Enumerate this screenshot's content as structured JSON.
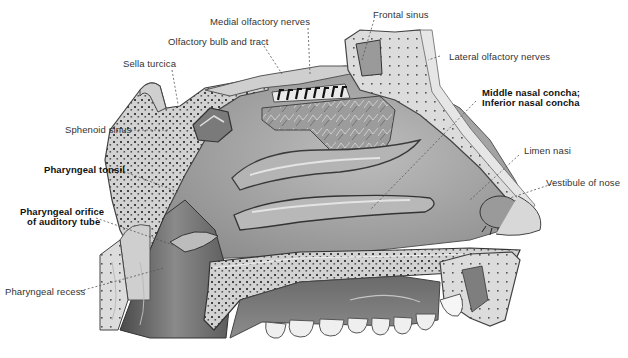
{
  "figure": {
    "labels": {
      "medial_olfactory_nerves": "Medial olfactory nerves",
      "frontal_sinus": "Frontal sinus",
      "olfactory_bulb_and_tract": "Olfactory bulb and tract",
      "lateral_olfactory_nerves": "Lateral olfactory nerves",
      "sella_turcica": "Sella turcica",
      "middle_nasal_concha": "Middle nasal concha;",
      "inferior_nasal_concha": "Inferior nasal concha",
      "sphenoid_sinus": "Sphenoid sinus",
      "limen_nasi": "Limen nasi",
      "pharyngeal_tonsil": "Pharyngeal tonsil",
      "vestibule_of_nose": "Vestibule of nose",
      "pharyngeal_orifice_line1": "Pharyngeal orifice",
      "pharyngeal_orifice_line2": "of auditory tube",
      "pharyngeal_recess": "Pharyngeal recess"
    },
    "colors": {
      "background": "#ffffff",
      "bone": "#d8d8d8",
      "bone_dark": "#9a9a9a",
      "mucosa": "#a8a8a8",
      "mucosa_dark": "#6e6e6e",
      "cavity_shadow": "#5a5a5a",
      "teeth": "#efefef",
      "label_text": "#333333",
      "leader_line": "#555555"
    }
  }
}
